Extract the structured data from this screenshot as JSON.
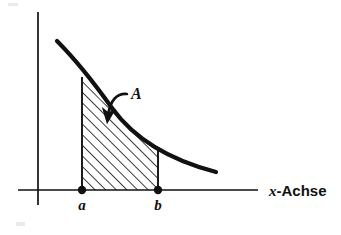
{
  "figure": {
    "background_color": "#ffffff",
    "ink_color": "#111111",
    "title": "",
    "axes": {
      "x_axis_label": "-Achse",
      "x_axis_label_variable": "x",
      "y_axis_label": "",
      "x_axis_start_px": 18,
      "x_axis_end_px": 258,
      "x_axis_y_px": 190,
      "y_axis_x_px": 38,
      "y_axis_top_px": 12,
      "y_axis_bottom_px": 205
    },
    "tick_labels": [
      {
        "name": "lower-bound",
        "text": "a",
        "x_px": 82,
        "label_y_px": 210
      },
      {
        "name": "upper-bound",
        "text": "b",
        "x_px": 158,
        "label_y_px": 210
      }
    ],
    "points": [
      {
        "name": "point-a",
        "x_px": 82,
        "y_px": 190,
        "radius_px": 4.2
      },
      {
        "name": "point-b",
        "x_px": 158,
        "y_px": 190,
        "radius_px": 4.2
      }
    ],
    "curve": {
      "name": "function-curve",
      "description": "decreasing convex curve",
      "stroke_width_px": 4.2,
      "path": "M 57,41 C 78,62 92,80 112,108 C 130,133 162,158 216,172"
    },
    "shaded_region": {
      "name": "area-under-curve",
      "label": "A",
      "label_x_px": 131,
      "label_y_px": 99,
      "hatch_angle_deg": 45,
      "hatch_spacing_px": 7.5,
      "hatch_stroke_width_px": 1.6,
      "left_boundary_x_px": 82,
      "right_boundary_x_px": 158,
      "baseline_y_px": 190,
      "top_path": "M 82,77 C 94,92 100,101 112,108 C 128,126 142,140 158,149"
    },
    "annotation_arrow": {
      "name": "area-pointer-arrow",
      "from_x_px": 128,
      "from_y_px": 93,
      "to_x_px": 109,
      "to_y_px": 122,
      "stroke_width_px": 2.6,
      "path": "M 127,94 C 118,93 110,99 108,116"
    }
  }
}
